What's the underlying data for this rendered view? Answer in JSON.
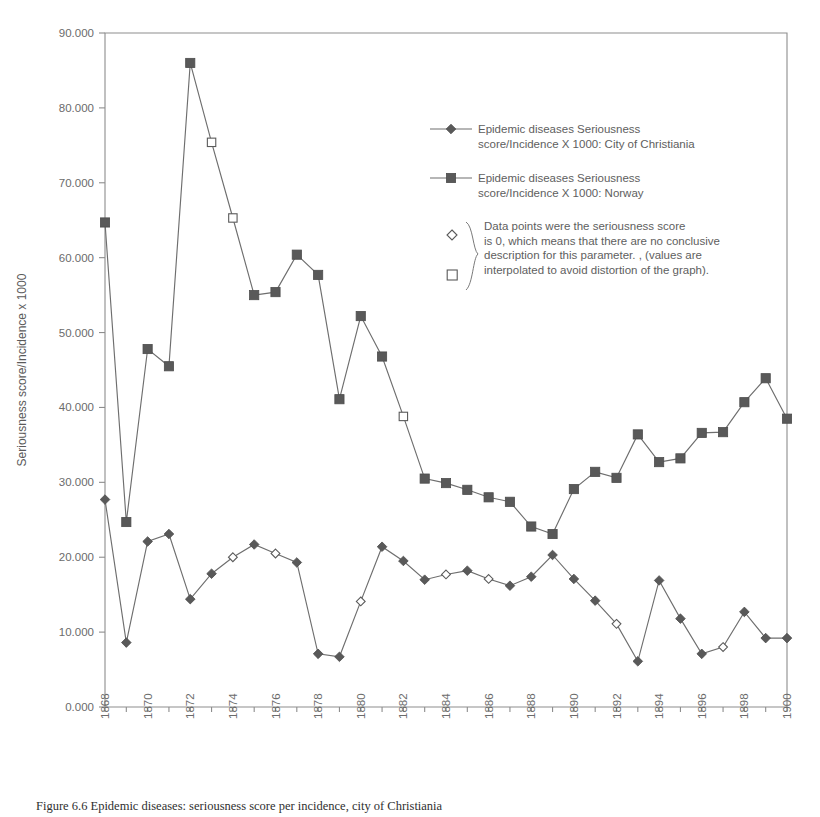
{
  "chart_data": {
    "type": "line",
    "title": "",
    "xlabel": "Year",
    "ylabel": "Seriousness score/Incidence x 1000",
    "xlim": [
      1868,
      1900
    ],
    "ylim": [
      0,
      90
    ],
    "grid": false,
    "legend_position": "upper-right-inside",
    "y_ticks": [
      "0.000",
      "10.000",
      "20.000",
      "30.000",
      "40.000",
      "50.000",
      "60.000",
      "70.000",
      "80.000",
      "90.000"
    ],
    "y_tick_values": [
      0,
      10,
      20,
      30,
      40,
      50,
      60,
      70,
      80,
      90
    ],
    "x_tick_labels": [
      "1868",
      "1870",
      "1872",
      "1874",
      "1876",
      "1878",
      "1880",
      "1882",
      "1884",
      "1886",
      "1888",
      "1890",
      "1892",
      "1894",
      "1896",
      "1898",
      "1900"
    ],
    "x": [
      1868,
      1869,
      1870,
      1871,
      1872,
      1873,
      1874,
      1875,
      1876,
      1877,
      1878,
      1879,
      1880,
      1881,
      1882,
      1883,
      1884,
      1885,
      1886,
      1887,
      1888,
      1889,
      1890,
      1891,
      1892,
      1893,
      1894,
      1895,
      1896,
      1897,
      1898,
      1899,
      1900
    ],
    "series": [
      {
        "name": "Epidemic diseases Seriousness score/Incidence X 1000: City of Christiania",
        "marker": "diamond",
        "color": "#595959",
        "values": [
          27.7,
          8.6,
          22.1,
          23.1,
          14.4,
          17.8,
          20.0,
          21.7,
          20.5,
          19.3,
          7.1,
          6.7,
          14.1,
          21.4,
          19.5,
          17.0,
          17.7,
          18.2,
          17.1,
          16.2,
          17.4,
          20.3,
          17.1,
          14.2,
          11.1,
          6.1,
          16.9,
          11.8,
          7.1,
          8.0,
          12.7,
          9.2,
          9.2
        ],
        "interpolated_x": [
          1874,
          1876,
          1880,
          1884,
          1886,
          1892,
          1897
        ]
      },
      {
        "name": "Epidemic diseases Seriousness score/Incidence X 1000: Norway",
        "marker": "square",
        "color": "#595959",
        "values": [
          64.7,
          24.7,
          47.8,
          45.5,
          86.0,
          75.4,
          65.3,
          55.0,
          55.4,
          60.4,
          57.7,
          41.1,
          52.2,
          46.8,
          38.8,
          30.5,
          29.9,
          29.0,
          28.0,
          27.4,
          24.1,
          23.1,
          29.1,
          31.4,
          30.6,
          36.4,
          32.7,
          33.2,
          36.6,
          36.7,
          40.7,
          43.9,
          38.5
        ],
        "interpolated_x": [
          1873,
          1874,
          1882
        ]
      }
    ]
  },
  "legend": {
    "entries": [
      {
        "line1": "Epidemic diseases Seriousness",
        "line2": "score/Incidence X 1000: City of Christiania",
        "marker": "diamond-icon"
      },
      {
        "line1": "Epidemic diseases Seriousness",
        "line2": "score/Incidence X 1000: Norway",
        "marker": "square-icon"
      }
    ],
    "note": {
      "line1": "Data points were the seriousness score",
      "line2": "is 0, which means that there are no conclusive",
      "line3": "description for this parameter. , (values are",
      "line4": "interpolated to avoid distortion of the graph).",
      "marker_diamond": "hollow-diamond-icon",
      "marker_square": "hollow-square-icon"
    }
  },
  "caption": {
    "text": "Figure 6.6 Epidemic diseases: seriousness score per incidence, city of Christiania"
  }
}
